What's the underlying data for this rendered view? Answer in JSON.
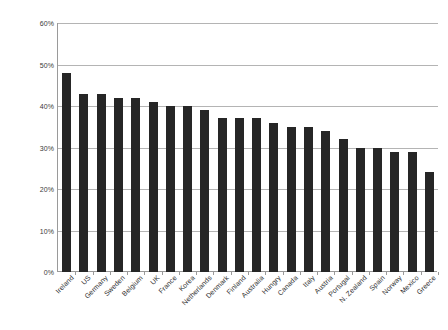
{
  "chart_data": {
    "type": "bar",
    "title": "",
    "subtitle": "",
    "xlabel": "",
    "ylabel": "",
    "ylim": [
      0,
      60
    ],
    "ytick_labels": [
      "0%",
      "10%",
      "20%",
      "30%",
      "40%",
      "50%",
      "60%"
    ],
    "ytick_values": [
      0,
      10,
      20,
      30,
      40,
      50,
      60
    ],
    "grid": true,
    "legend": null,
    "legend_position": "none",
    "bar_color": "#262626",
    "gridline_color": "#b4b4b4",
    "axis_color": "#9a9a9a",
    "categories": [
      "Ireland",
      "US",
      "Germany",
      "Sweden",
      "Belgium",
      "UK",
      "France",
      "Korea",
      "Netherlands",
      "Denmark",
      "Finland",
      "Australia",
      "Hungry",
      "Canada",
      "Italy",
      "Austria",
      "Portugal",
      "N. Zealand",
      "Spain",
      "Norway",
      "Mexico",
      "Greece"
    ],
    "values": [
      48,
      43,
      43,
      42,
      42,
      41,
      40,
      40,
      39,
      37,
      37,
      37,
      36,
      35,
      35,
      34,
      32,
      30,
      30,
      29,
      29,
      24
    ],
    "value_unit": "%"
  }
}
